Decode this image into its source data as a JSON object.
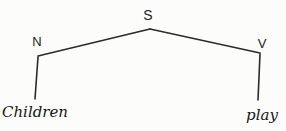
{
  "tree": {
    "type": "syntax-tree",
    "root": {
      "label": "S"
    },
    "branches": [
      {
        "label": "N",
        "word": "Children"
      },
      {
        "label": "V",
        "word": "play"
      }
    ]
  },
  "colors": {
    "line": "#2b2b2b",
    "node_text": "#222222",
    "word_text": "#161616",
    "background": "#fcfcfb"
  }
}
